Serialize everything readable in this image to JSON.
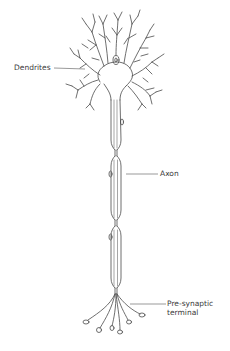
{
  "diagram": {
    "labels": {
      "dendrites": "Dendrites",
      "axon": "Axon",
      "presynaptic_line1": "Pre-synaptic",
      "presynaptic_line2": "terminal"
    },
    "colors": {
      "line": "#4a4a4a",
      "text": "#3a3a3a",
      "background": "#ffffff"
    }
  }
}
